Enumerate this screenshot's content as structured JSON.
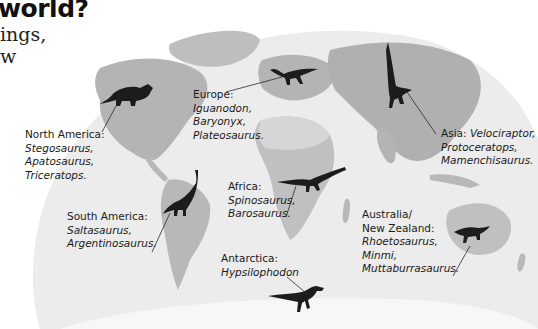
{
  "heading": {
    "title_fragment": "world?",
    "intro_lines": [
      "ings,",
      "w"
    ]
  },
  "colors": {
    "ocean": "#ededed",
    "land": "#bdbdbd",
    "land_dark": "#a8a8a8",
    "ice": "#f8f8f8",
    "dinosaur": "#1c1c1c",
    "text": "#1a1a1a"
  },
  "regions": [
    {
      "id": "north-america",
      "name": "North America:",
      "dinosaurs": [
        "Stegosaurus,",
        "Apatosaurus,",
        "Triceratops."
      ],
      "silhouette": "triceratops"
    },
    {
      "id": "europe",
      "name": "Europe:",
      "dinosaurs": [
        "Iguanodon,",
        "Baryonyx,",
        "Plateosaurus."
      ],
      "silhouette": "iguanodon"
    },
    {
      "id": "asia",
      "name": "Asia:",
      "dinosaurs": [
        "Velociraptor,",
        "Protoceratops,",
        "Mamenchisaurus."
      ],
      "silhouette": "velociraptor"
    },
    {
      "id": "south-america",
      "name": "South America:",
      "dinosaurs": [
        "Saltasaurus,",
        "Argentinosaurus."
      ],
      "silhouette": "sauropod"
    },
    {
      "id": "africa",
      "name": "Africa:",
      "dinosaurs": [
        "Spinosaurus,",
        "Barosaurus."
      ],
      "silhouette": "barosaurus"
    },
    {
      "id": "australia",
      "name_lines": [
        "Australia/",
        "New Zealand:"
      ],
      "dinosaurs": [
        "Rhoetosaurus,",
        "Minmi,",
        "Muttaburrasaurus."
      ],
      "silhouette": "minmi"
    },
    {
      "id": "antarctica",
      "name": "Antarctica:",
      "dinosaurs": [
        "Hypsilophodon"
      ],
      "silhouette": "hypsilophodon"
    }
  ]
}
